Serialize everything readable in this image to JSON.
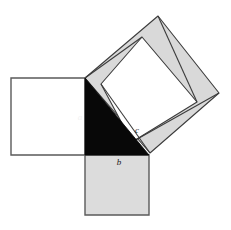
{
  "figure": {
    "width": 231,
    "height": 230,
    "background_color": "#ffffff"
  },
  "colors": {
    "outline": "#5a5a5a",
    "outline_dark": "#3c3c3c",
    "square_a_fill": "#ffffff",
    "square_b_fill": "#dcdcdc",
    "square_c_inner_fill": "#ffffff",
    "square_c_triangle_fill": "#d9d9d9",
    "triangle_fill": "#080808",
    "label_color": "#1a1a1a",
    "label_color_on_dark": "#f2f2f2"
  },
  "labels": {
    "leg_a": "a",
    "leg_b": "b",
    "hypotenuse_c": "c"
  },
  "geometry": {
    "right_angle_vertex": [
      85,
      155
    ],
    "leg_a_top": [
      85,
      78
    ],
    "leg_b_right": [
      149,
      155
    ],
    "square_a": [
      [
        11,
        78
      ],
      [
        85,
        78
      ],
      [
        85,
        155
      ],
      [
        11,
        155
      ]
    ],
    "square_b": [
      [
        85,
        155
      ],
      [
        149,
        155
      ],
      [
        149,
        215
      ],
      [
        85,
        215
      ]
    ],
    "square_c": [
      [
        85,
        78
      ],
      [
        158,
        16
      ],
      [
        219,
        93
      ],
      [
        150,
        153
      ]
    ],
    "square_c_inner": [
      [
        142,
        37
      ],
      [
        197,
        102
      ],
      [
        132,
        142
      ],
      [
        101,
        84
      ]
    ],
    "triangle": [
      [
        85,
        78
      ],
      [
        85,
        155
      ],
      [
        149,
        155
      ]
    ],
    "label_positions": {
      "a": [
        80,
        118
      ],
      "b": [
        119,
        163
      ],
      "c": [
        137,
        131
      ]
    }
  }
}
